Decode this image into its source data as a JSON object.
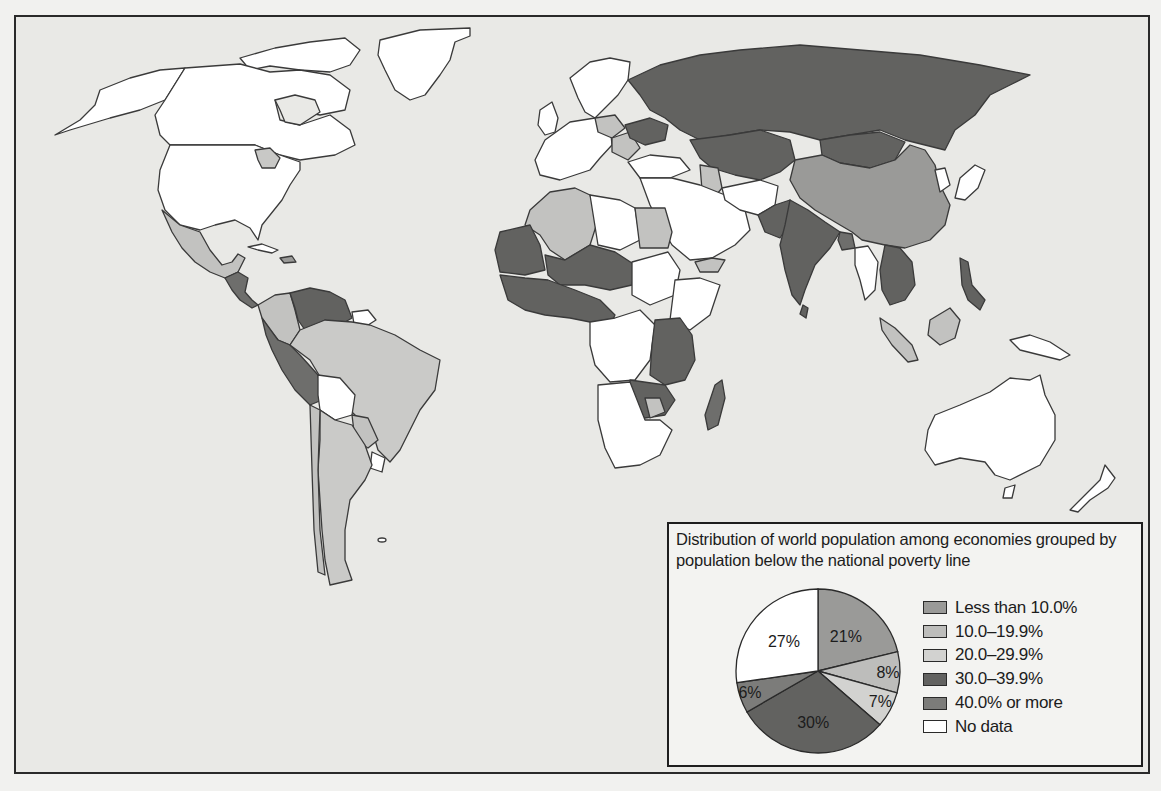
{
  "figure": {
    "type": "choropleth-map-with-pie-inset",
    "background_color": "#e9e9e6",
    "ocean_color": "#e9e9e6"
  },
  "legend": {
    "title": "Distribution of world population among economies grouped by population below the national poverty line",
    "items": [
      {
        "label": "Less than 10.0%",
        "color": "#9a9a98"
      },
      {
        "label": "10.0–19.9%",
        "color": "#bdbdbb"
      },
      {
        "label": "20.0–29.9%",
        "color": "#d2d2d0"
      },
      {
        "label": "30.0–39.9%",
        "color": "#626260"
      },
      {
        "label": "40.0% or more",
        "color": "#7c7c7a"
      },
      {
        "label": "No data",
        "color": "#ffffff"
      }
    ]
  },
  "chart_data": {
    "type": "pie",
    "title": "Distribution of world population among economies grouped by population below the national poverty line",
    "categories": [
      "Less than 10.0%",
      "10.0–19.9%",
      "20.0–29.9%",
      "30.0–39.9%",
      "40.0% or more",
      "No data"
    ],
    "values": [
      21,
      8,
      7,
      30,
      6,
      27
    ],
    "labels": [
      "21%",
      "8%",
      "7%",
      "30%",
      "6%",
      "27%"
    ],
    "colors": [
      "#9a9a98",
      "#bdbdbb",
      "#d2d2d0",
      "#626260",
      "#7c7c7a",
      "#ffffff"
    ],
    "legend_position": "right",
    "map": {
      "type": "choropleth",
      "regions": [
        {
          "name": "Russia",
          "class": "30.0–39.9%"
        },
        {
          "name": "Kazakhstan",
          "class": "30.0–39.9%"
        },
        {
          "name": "Mongolia",
          "class": "30.0–39.9%"
        },
        {
          "name": "India",
          "class": "30.0–39.9%"
        },
        {
          "name": "Pakistan",
          "class": "30.0–39.9%"
        },
        {
          "name": "Bangladesh",
          "class": "40.0% or more"
        },
        {
          "name": "China",
          "class": "Less than 10.0%"
        },
        {
          "name": "Southeast Asia (Laos/Cambodia/Vietnam)",
          "class": "30.0–39.9%"
        },
        {
          "name": "Philippines",
          "class": "30.0–39.9%"
        },
        {
          "name": "Indonesia",
          "class": "10.0–19.9%"
        },
        {
          "name": "Brazil",
          "class": "20.0–29.9%"
        },
        {
          "name": "Argentina",
          "class": "20.0–29.9%"
        },
        {
          "name": "Peru/Ecuador",
          "class": "40.0% or more"
        },
        {
          "name": "Venezuela/Guyana",
          "class": "30.0–39.9%"
        },
        {
          "name": "Colombia",
          "class": "20.0–29.9%"
        },
        {
          "name": "Mexico",
          "class": "20.0–29.9%"
        },
        {
          "name": "Central America",
          "class": "40.0% or more"
        },
        {
          "name": "Bolivia",
          "class": "No data"
        },
        {
          "name": "United States",
          "class": "No data"
        },
        {
          "name": "Canada",
          "class": "No data"
        },
        {
          "name": "Greenland",
          "class": "No data"
        },
        {
          "name": "Australia",
          "class": "No data"
        },
        {
          "name": "Madagascar",
          "class": "40.0% or more"
        },
        {
          "name": "West Africa",
          "class": "40.0% or more"
        },
        {
          "name": "East Africa",
          "class": "40.0% or more"
        },
        {
          "name": "Algeria/Morocco",
          "class": "20.0–29.9%"
        },
        {
          "name": "Egypt",
          "class": "20.0–29.9%"
        }
      ]
    }
  }
}
